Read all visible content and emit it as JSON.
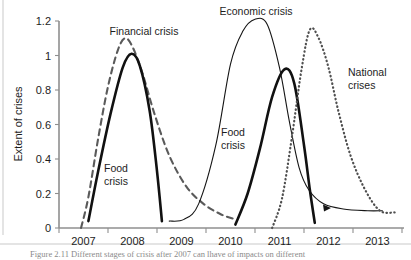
{
  "figure": {
    "caption": "Figure 2.11  Different stages of crisis after 2007 can lhave of impacts on different"
  },
  "chart_data": {
    "type": "line",
    "title": "",
    "xlabel": "",
    "ylabel": "Extent of crises",
    "xlim": [
      2006.5,
      2013.5
    ],
    "ylim": [
      0,
      1.2
    ],
    "grid": false,
    "legend_position": "inline-annotations",
    "xticks": [
      "2007",
      "2008",
      "2009",
      "2010",
      "2011",
      "2012",
      "2013"
    ],
    "yticks": [
      "0",
      "0.2",
      "0.4",
      "0.6",
      "0.8",
      "1",
      "1.2"
    ],
    "series": [
      {
        "name": "Financial crisis",
        "style": "dashed",
        "color": "#5a5a5a",
        "peak_x": 2007.85,
        "peak_y": 1.1,
        "x": [
          2006.95,
          2007.1,
          2007.3,
          2007.5,
          2007.7,
          2007.85,
          2008.0,
          2008.2,
          2008.45,
          2008.75,
          2009.1,
          2009.45,
          2009.8,
          2010.1
        ],
        "y": [
          0.0,
          0.18,
          0.52,
          0.82,
          1.03,
          1.1,
          1.05,
          0.9,
          0.66,
          0.42,
          0.24,
          0.14,
          0.08,
          0.05
        ]
      },
      {
        "name": "Food crisis",
        "style": "solid-bold",
        "color": "#111111",
        "peak_x": 2007.98,
        "peak_y": 1.01,
        "x": [
          2007.1,
          2007.3,
          2007.55,
          2007.8,
          2007.98,
          2008.15,
          2008.35,
          2008.5,
          2008.6
        ],
        "y": [
          0.04,
          0.33,
          0.66,
          0.93,
          1.01,
          0.94,
          0.68,
          0.33,
          0.04
        ]
      },
      {
        "name": "Economic crisis",
        "style": "solid-thin",
        "color": "#151515",
        "peak_x": 2010.5,
        "peak_y": 1.21,
        "x": [
          2008.75,
          2009.05,
          2009.35,
          2009.7,
          2010.0,
          2010.25,
          2010.5,
          2010.75,
          2011.0,
          2011.2,
          2011.4,
          2011.6,
          2011.9,
          2012.3,
          2012.8,
          2013.1
        ],
        "y": [
          0.04,
          0.05,
          0.14,
          0.48,
          0.95,
          1.14,
          1.21,
          1.18,
          0.93,
          0.62,
          0.35,
          0.22,
          0.14,
          0.11,
          0.1,
          0.1
        ]
      },
      {
        "name": "Food crisis",
        "style": "solid-bold",
        "color": "#111111",
        "peak_x": 2011.1,
        "peak_y": 0.92,
        "x": [
          2010.1,
          2010.35,
          2010.6,
          2010.85,
          2011.1,
          2011.3,
          2011.5,
          2011.62,
          2011.72
        ],
        "y": [
          0.02,
          0.2,
          0.46,
          0.76,
          0.92,
          0.84,
          0.48,
          0.22,
          0.03
        ]
      },
      {
        "name": "National crises",
        "style": "dotted",
        "color": "#4f4f4f",
        "peak_x": 2011.62,
        "peak_y": 1.15,
        "x": [
          2010.85,
          2011.05,
          2011.25,
          2011.45,
          2011.62,
          2011.8,
          2012.0,
          2012.2,
          2012.45,
          2012.75,
          2013.05,
          2013.35
        ],
        "y": [
          0.0,
          0.17,
          0.52,
          0.92,
          1.15,
          1.1,
          0.93,
          0.68,
          0.42,
          0.22,
          0.1,
          0.09
        ]
      }
    ],
    "annotations": [
      {
        "text": "Financial crisis",
        "x": 2008.0,
        "y": 1.16
      },
      {
        "text": "Economic crisis",
        "x": 2010.45,
        "y": 1.31
      },
      {
        "text": "National crises",
        "x": 2012.7,
        "y": 0.89
      },
      {
        "text": "Food crisis",
        "x": 2007.9,
        "y": 0.33
      },
      {
        "text": "Food crisis",
        "x": 2010.45,
        "y": 0.52
      }
    ],
    "annotation_lines": {
      "financial": [
        "Financial crisis"
      ],
      "economic": [
        "Economic crisis"
      ],
      "national": [
        "National",
        "crises"
      ],
      "food_left": [
        "Food",
        "crisis"
      ],
      "food_right": [
        "Food",
        "crisis"
      ]
    }
  }
}
